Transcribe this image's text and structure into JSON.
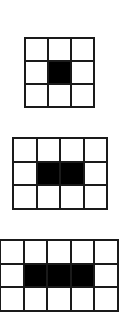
{
  "diagram": {
    "colors": {
      "line": "#1a1a1a",
      "filled": "#000000",
      "empty": "#ffffff",
      "background": "#ffffff"
    },
    "grids": [
      {
        "name": "grid-3x3-one-center",
        "rows": 3,
        "cols": 3,
        "x": 24,
        "y": 37,
        "cell_size": 23,
        "filled": [
          [
            1,
            1
          ]
        ]
      },
      {
        "name": "grid-3x4-two-center",
        "rows": 3,
        "cols": 4,
        "x": 12,
        "y": 137,
        "cell_size": 23.5,
        "filled": [
          [
            1,
            1
          ],
          [
            1,
            2
          ]
        ]
      },
      {
        "name": "grid-3x5-three-center",
        "rows": 3,
        "cols": 5,
        "x": -1,
        "y": 239,
        "cell_size": 23.5,
        "filled": [
          [
            1,
            1
          ],
          [
            1,
            2
          ],
          [
            1,
            3
          ]
        ]
      }
    ]
  }
}
